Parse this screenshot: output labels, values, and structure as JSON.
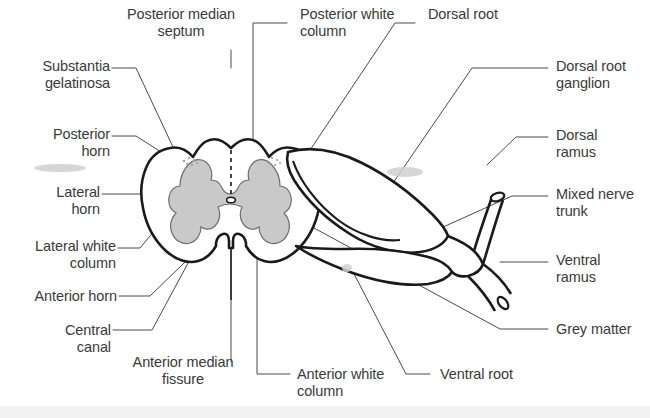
{
  "figure": {
    "background_color": "#ffffff",
    "ink_color": "#1a1a1a",
    "leader_color": "#4a4a4a",
    "text_color": "#3a3a3a",
    "grey_matter_fill": "#c9c9c9",
    "white_matter_fill": "#ffffff"
  },
  "labels": {
    "posterior_median_septum": "Posterior median\nseptum",
    "posterior_white_column": "Posterior white\ncolumn",
    "dorsal_root": "Dorsal root",
    "dorsal_root_ganglion": "Dorsal root\nganglion",
    "substantia_gelatinosa": "Substantia\ngelatinosa",
    "posterior_horn": "Posterior\nhorn",
    "dorsal_ramus": "Dorsal\nramus",
    "lateral_horn": "Lateral\nhorn",
    "mixed_nerve_trunk": "Mixed nerve\ntrunk",
    "lateral_white_column": "Lateral white\ncolumn",
    "ventral_ramus": "Ventral\nramus",
    "anterior_horn": "Anterior horn",
    "central_canal": "Central\ncanal",
    "grey_matter": "Grey matter",
    "anterior_median_fissure": "Anterior median\nfissure",
    "anterior_white_column": "Anterior white\ncolumn",
    "ventral_root": "Ventral root"
  }
}
